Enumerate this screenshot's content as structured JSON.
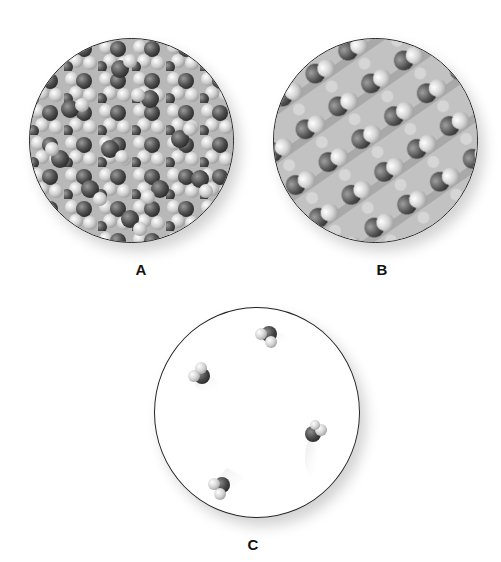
{
  "figure": {
    "panels": [
      {
        "id": "A",
        "label": "A",
        "description": "Liquid water: closely packed, disordered molecules"
      },
      {
        "id": "B",
        "label": "B",
        "description": "Solid ice: ordered crystalline lattice of molecules"
      },
      {
        "id": "C",
        "label": "C",
        "description": "Water vapor: few widely spaced molecules"
      }
    ],
    "molecule_counts": {
      "C": 4
    },
    "colors": {
      "oxygen": "#555555",
      "hydrogen": "#d8d8d8",
      "outline": "#222222",
      "background": "#ffffff"
    }
  }
}
